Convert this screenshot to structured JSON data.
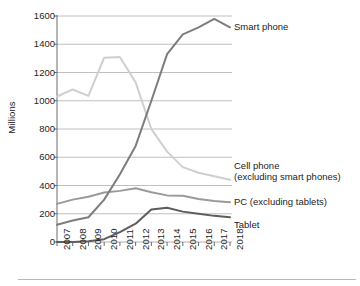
{
  "chart_data": {
    "type": "line",
    "title": "",
    "xlabel": "",
    "ylabel": "Millions",
    "categories": [
      "2007",
      "2008",
      "2009",
      "2010",
      "2011",
      "2012",
      "2013",
      "2014",
      "2015",
      "2016",
      "2017",
      "2018"
    ],
    "x": [
      2007,
      2008,
      2009,
      2010,
      2011,
      2012,
      2013,
      2014,
      2015,
      2016,
      2017,
      2018
    ],
    "ylim": [
      0,
      1600
    ],
    "yticks": [
      0,
      200,
      400,
      600,
      800,
      1000,
      1200,
      1400,
      1600
    ],
    "grid": true,
    "legend_position": "right-inline-labels",
    "series": [
      {
        "name": "Smart phone",
        "color": "#7d7d7d",
        "values": [
          122,
          152,
          175,
          300,
          480,
          680,
          1000,
          1330,
          1470,
          1520,
          1580,
          1520
        ]
      },
      {
        "name": "Cell phone (excluding smart phones)",
        "color": "#cfcfcf",
        "values": [
          1030,
          1080,
          1035,
          1305,
          1310,
          1130,
          800,
          640,
          530,
          490,
          465,
          440
        ]
      },
      {
        "name": "PC (excluding tablets)",
        "color": "#9a9a9a",
        "values": [
          270,
          300,
          320,
          350,
          362,
          380,
          352,
          330,
          328,
          305,
          290,
          282
        ]
      },
      {
        "name": "Tablet",
        "color": "#5d5d5d",
        "values": [
          0,
          0,
          5,
          20,
          70,
          130,
          230,
          243,
          215,
          200,
          185,
          175
        ]
      }
    ]
  },
  "axis": {
    "y_title": "Millions",
    "y_tick_labels": [
      "1600",
      "1400",
      "1200",
      "1000",
      "800",
      "600",
      "400",
      "200",
      "0"
    ],
    "x_tick_labels": [
      "2007",
      "2008",
      "2009",
      "2010",
      "2011",
      "2012",
      "2013",
      "2014",
      "2015",
      "2016",
      "2017",
      "2018"
    ]
  },
  "series_labels": {
    "smart_phone": "Smart phone",
    "cell_phone_line1": "Cell phone",
    "cell_phone_line2": "(excluding smart phones)",
    "pc": "PC (excluding tablets)",
    "tablet": "Tablet"
  },
  "colors": {
    "smart_phone": "#7d7d7d",
    "cell_phone": "#cfcfcf",
    "pc": "#9a9a9a",
    "tablet": "#5d5d5d",
    "grid": "#b0b0b0",
    "axis": "#6b6b6b"
  }
}
